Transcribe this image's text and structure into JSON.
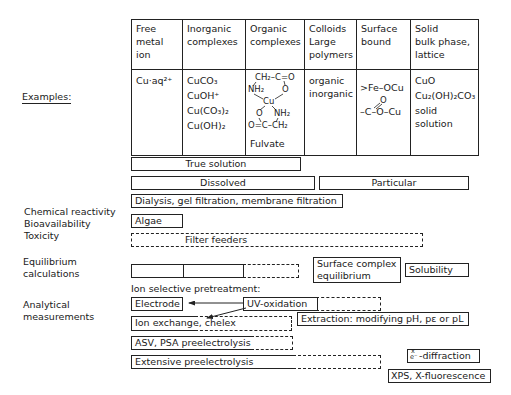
{
  "left_labels": {
    "examples": "Examples:",
    "reactivity": [
      "Chemical reactivity",
      "Bioavailability",
      "Toxicity"
    ],
    "equilibrium": [
      "Equilibrium",
      "calculations"
    ],
    "analytical": [
      "Analytical",
      "measurements"
    ]
  },
  "table": {
    "headers": [
      [
        "Free",
        "metal",
        "ion"
      ],
      [
        "Inorganic",
        "complexes"
      ],
      [
        "Organic",
        "complexes"
      ],
      [
        "Colloids",
        "Large",
        "polymers"
      ],
      [
        "Surface",
        "bound"
      ],
      [
        "Solid",
        "bulk phase,",
        "lattice"
      ]
    ],
    "examples": {
      "free_metal": "Cu·aq²⁺",
      "inorganic": [
        "CuCO₃",
        "CuOH⁺",
        "Cu(CO₃)₂",
        "Cu(OH)₂"
      ],
      "organic": {
        "structure_lines": [
          "CH₂–C=O",
          "NH₂      O",
          "Cu",
          "O      NH₂",
          "O=C–CH₂"
        ],
        "caption": "Fulvate"
      },
      "colloids": [
        "organic",
        "inorganic"
      ],
      "surface": [
        ">Fe–OCu",
        "O",
        "–C–O–Cu"
      ],
      "solid": [
        "CuO",
        "Cu₂(OH)₂CO₃",
        "solid",
        "solution"
      ]
    }
  },
  "bars": {
    "true_solution": "True solution",
    "dissolved": "Dissolved",
    "particular": "Particular",
    "dialysis": "Dialysis, gel filtration, membrane filtration",
    "algae": "Algae",
    "filter_feeders": "Filter feeders",
    "surface_complex": [
      "Surface complex",
      "equilibrium"
    ],
    "solubility": "Solubility",
    "ion_selective": "Ion selective pretreatment:",
    "electrode": "Electrode",
    "uv_oxidation": "UV-oxidation",
    "ion_exchange": "Ion exchange, chelex",
    "extraction": "Extraction: modifying pH, pε or pL",
    "asv_psa": "ASV, PSA preelectrolysis",
    "extensive": "Extensive preelectrolysis",
    "diffraction_prefix_top": "x",
    "diffraction_prefix_bottom": "e⁻",
    "diffraction": "-diffraction",
    "xps": "XPS, X-fluorescence"
  }
}
